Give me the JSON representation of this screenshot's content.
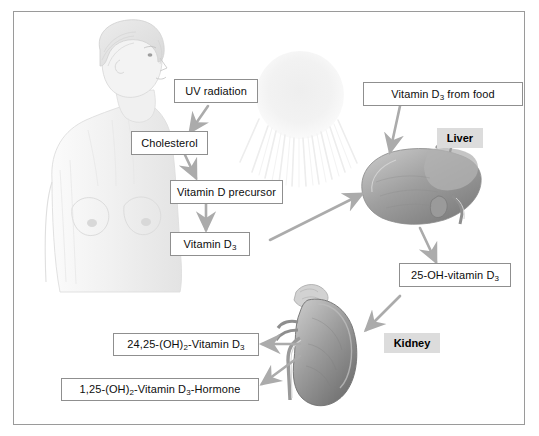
{
  "figure": {
    "border_color": "#9a9a9a",
    "background": "#ffffff",
    "arrow_color": "#a9a9a9",
    "organ_badge_bg": "#dcdcdc"
  },
  "labels": {
    "uv_radiation": "UV radiation",
    "cholesterol": "Cholesterol",
    "vitamin_d_precursor": "Vitamin D precursor",
    "vitamin_d3": "Vitamin D",
    "vitamin_d3_sub": "3",
    "vitamin_d3_from_food_pre": "Vitamin D",
    "vitamin_d3_from_food_sub": "3",
    "vitamin_d3_from_food_post": " from food",
    "hydroxy_vitamin_d3_pre": "25-OH-vitamin D",
    "hydroxy_vitamin_d3_sub": "3",
    "dihydroxy_2425_pre": "24,25-(OH)",
    "dihydroxy_2425_sub1": "2",
    "dihydroxy_2425_mid": "-Vitamin D",
    "dihydroxy_2425_sub2": "3",
    "hormone_125_pre": "1,25-(OH)",
    "hormone_125_sub1": "2",
    "hormone_125_mid": "-Vitamin D",
    "hormone_125_sub2": "3",
    "hormone_125_post": "-Hormone"
  },
  "organs": {
    "liver": "Liver",
    "kidney": "Kidney"
  },
  "illustrations": [
    {
      "name": "woman-torso",
      "description": "pencil sketch of a woman's head and torso in profile"
    },
    {
      "name": "sun",
      "description": "faint sun disc with downward radiating rays"
    },
    {
      "name": "liver",
      "description": "shaded drawing of a human liver with gallbladder"
    },
    {
      "name": "kidney",
      "description": "shaded drawing of a human kidney with adrenal gland and vessels"
    }
  ],
  "arrows": [
    {
      "name": "uv-to-cholesterol",
      "from": "UV radiation",
      "to": "Cholesterol"
    },
    {
      "name": "cholesterol-to-precursor",
      "from": "Cholesterol",
      "to": "Vitamin D precursor"
    },
    {
      "name": "precursor-to-vitamin-d3",
      "from": "Vitamin D precursor",
      "to": "Vitamin D3"
    },
    {
      "name": "vitamin-d3-to-liver",
      "from": "Vitamin D3",
      "to": "Liver"
    },
    {
      "name": "food-to-liver",
      "from": "Vitamin D3 from food",
      "to": "Liver"
    },
    {
      "name": "liver-to-25oh",
      "from": "Liver",
      "to": "25-OH-vitamin D3"
    },
    {
      "name": "25oh-to-kidney",
      "from": "25-OH-vitamin D3",
      "to": "Kidney"
    },
    {
      "name": "kidney-to-2425",
      "from": "Kidney",
      "to": "24,25-(OH)2-Vitamin D3"
    },
    {
      "name": "kidney-to-hormone",
      "from": "Kidney",
      "to": "1,25-(OH)2-Vitamin D3-Hormone"
    }
  ]
}
